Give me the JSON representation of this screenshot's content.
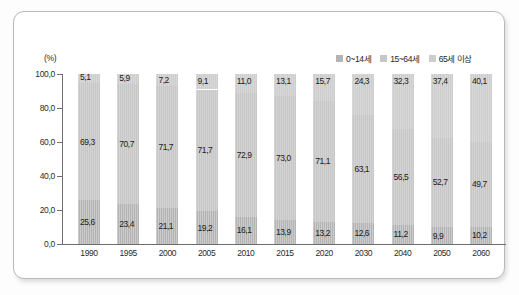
{
  "chart_data": {
    "type": "bar",
    "subtype": "stacked-100-percent",
    "title": "",
    "xlabel": "",
    "ylabel": "(%)",
    "ylim": [
      0.0,
      100.0
    ],
    "yticks": [
      "0,0",
      "20,0",
      "40,0",
      "60,0",
      "80,0",
      "100,0"
    ],
    "ytick_values": [
      0.0,
      20.0,
      40.0,
      60.0,
      80.0,
      100.0
    ],
    "grid": false,
    "legend_position": "top-right",
    "categories": [
      "1990",
      "1995",
      "2000",
      "2005",
      "2010",
      "2015",
      "2020",
      "2030",
      "2040",
      "2050",
      "2060"
    ],
    "series": [
      {
        "name": "0~14세",
        "color": "#b4b4b4",
        "values": [
          25.6,
          23.4,
          21.1,
          19.2,
          16.1,
          13.9,
          13.2,
          12.6,
          11.2,
          9.9,
          10.2
        ],
        "labels": [
          "25,6",
          "23,4",
          "21,1",
          "19,2",
          "16,1",
          "13,9",
          "13,2",
          "12,6",
          "11,2",
          "9,9",
          "10,2"
        ]
      },
      {
        "name": "15~64세",
        "color": "#c7c7c7",
        "values": [
          69.3,
          70.7,
          71.7,
          71.7,
          72.9,
          73.0,
          71.1,
          63.1,
          56.5,
          52.7,
          49.7
        ],
        "labels": [
          "69,3",
          "70,7",
          "71,7",
          "71,7",
          "72,9",
          "73,0",
          "71,1",
          "63,1",
          "56,5",
          "52,7",
          "49,7"
        ]
      },
      {
        "name": "65세 이상",
        "color": "#cdcdcd",
        "values": [
          5.1,
          5.9,
          7.2,
          9.1,
          11.0,
          13.1,
          15.7,
          24.3,
          32.3,
          37.4,
          40.1
        ],
        "labels": [
          "5,1",
          "5,9",
          "7,2",
          "9,1",
          "11,0",
          "13,1",
          "15,7",
          "24,3",
          "32,3",
          "37,4",
          "40,1"
        ]
      }
    ]
  },
  "axes": {
    "y_unit_label": "(%)"
  },
  "legend": {
    "items": [
      {
        "label": "0~14세",
        "color": "#b4b4b4"
      },
      {
        "label": "15~64세",
        "color": "#c7c7c7"
      },
      {
        "label": "65세 이상",
        "color": "#cdcdcd"
      }
    ]
  }
}
